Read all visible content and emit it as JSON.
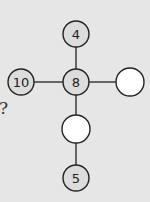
{
  "diagram": {
    "question_mark": "?",
    "nodes": [
      {
        "id": "top",
        "label": "4",
        "cx": 76,
        "cy": 34,
        "filled": true
      },
      {
        "id": "left",
        "label": "10",
        "cx": 21,
        "cy": 82,
        "filled": true
      },
      {
        "id": "center",
        "label": "8",
        "cx": 76,
        "cy": 82,
        "filled": true
      },
      {
        "id": "right",
        "label": "",
        "cx": 130,
        "cy": 82,
        "filled": false
      },
      {
        "id": "lower",
        "label": "",
        "cx": 76,
        "cy": 129,
        "filled": false
      },
      {
        "id": "bottom",
        "label": "5",
        "cx": 76,
        "cy": 178,
        "filled": true
      }
    ],
    "colors": {
      "background": "#e6e6e6",
      "filled_node": "#dcdcdc",
      "empty_node": "#ffffff",
      "stroke": "#222222"
    }
  }
}
